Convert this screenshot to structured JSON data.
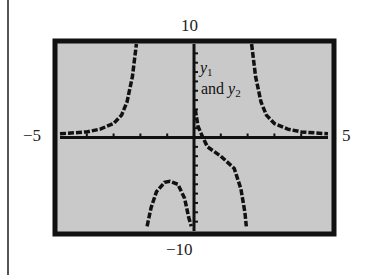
{
  "chart_data": {
    "type": "line",
    "title": "",
    "xlabel": "",
    "ylabel": "",
    "xlim": [
      -5,
      5
    ],
    "ylim": [
      -10,
      10
    ],
    "grid": false,
    "axis_labels": {
      "ymax": "10",
      "ymin": "−10",
      "xmin": "−5",
      "xmax": "5"
    },
    "annotation": {
      "line1_var": "y",
      "line1_sub": "1",
      "line2_text": "and ",
      "line2_var": "y",
      "line2_sub": "2"
    },
    "x_ticks": [
      -4,
      -3,
      -2,
      -1,
      0,
      1,
      2,
      3,
      4
    ],
    "y_ticks": [
      -9,
      -8,
      -7,
      -6,
      -5,
      -4,
      -3,
      -2,
      -1,
      1,
      2,
      3,
      4,
      5,
      6,
      7,
      8,
      9
    ],
    "series": [
      {
        "name": "y1 and y2 (left upper branch)",
        "points": [
          [
            -5,
            0.4
          ],
          [
            -4,
            0.6
          ],
          [
            -3.5,
            0.9
          ],
          [
            -3,
            1.5
          ],
          [
            -2.7,
            2.4
          ],
          [
            -2.5,
            3.8
          ],
          [
            -2.3,
            6.5
          ],
          [
            -2.15,
            10
          ]
        ]
      },
      {
        "name": "y1 and y2 (right upper branch)",
        "points": [
          [
            2.15,
            10
          ],
          [
            2.3,
            6.5
          ],
          [
            2.5,
            3.8
          ],
          [
            2.7,
            2.4
          ],
          [
            3,
            1.5
          ],
          [
            3.5,
            0.9
          ],
          [
            4,
            0.6
          ],
          [
            5,
            0.4
          ]
        ]
      },
      {
        "name": "y1 and y2 (near origin, right)",
        "points": [
          [
            0.05,
            3
          ],
          [
            0.15,
            1.2
          ],
          [
            0.3,
            0.2
          ],
          [
            0.5,
            -1.0
          ],
          [
            1.0,
            -2.0
          ],
          [
            1.5,
            -3.3
          ],
          [
            1.75,
            -5.5
          ],
          [
            1.9,
            -8
          ],
          [
            1.95,
            -9.5
          ]
        ]
      },
      {
        "name": "y1 and y2 (lower arch)",
        "points": [
          [
            -1.75,
            -9.5
          ],
          [
            -1.6,
            -7.5
          ],
          [
            -1.4,
            -5.8
          ],
          [
            -1.1,
            -4.8
          ],
          [
            -0.9,
            -4.7
          ],
          [
            -0.6,
            -5.0
          ],
          [
            -0.35,
            -6.5
          ],
          [
            -0.2,
            -8.5
          ],
          [
            -0.1,
            -9.5
          ]
        ]
      }
    ]
  }
}
